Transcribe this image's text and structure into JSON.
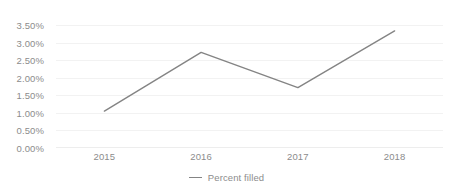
{
  "chart_data": {
    "type": "line",
    "title": "",
    "subtitle": "",
    "xlabel": "",
    "ylabel": "",
    "categories": [
      "2015",
      "2016",
      "2017",
      "2018"
    ],
    "series": [
      {
        "name": "Percent filled",
        "values": [
          1.05,
          2.72,
          1.72,
          3.33
        ],
        "color": "#848484"
      }
    ],
    "ylim": [
      0,
      3.5
    ],
    "y_ticks": [
      0,
      0.5,
      1.0,
      1.5,
      2.0,
      2.5,
      3.0,
      3.5
    ],
    "y_tick_labels": [
      "0.00%",
      "0.50%",
      "1.00%",
      "1.50%",
      "2.00%",
      "2.50%",
      "3.00%",
      "3.50%"
    ],
    "x_tick_labels": [
      "2015",
      "2016",
      "2017",
      "2018"
    ],
    "grid": true,
    "grid_axis": "y",
    "grid_color": "#f2f2f2",
    "legend": {
      "position": "bottom",
      "entries": [
        {
          "label": "Percent filled",
          "marker": "line-marker",
          "color": "#848484"
        }
      ]
    },
    "axis_label_color": "#8c8c8c",
    "background_color": "#ffffff"
  }
}
